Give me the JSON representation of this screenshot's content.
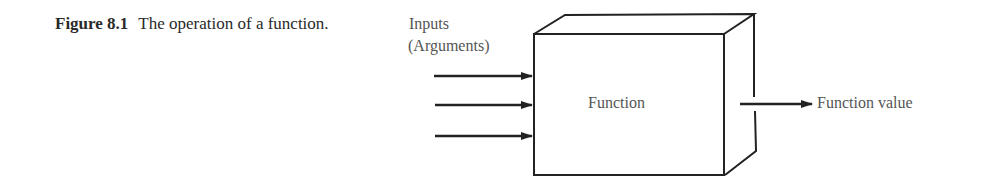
{
  "caption": {
    "figure_number": "Figure 8.1",
    "text": "The operation of a function."
  },
  "diagram": {
    "inputs_label_line1": "Inputs",
    "inputs_label_line2": "(Arguments)",
    "box_label": "Function",
    "output_label": "Function value",
    "input_arrow_count": 3,
    "stroke_color": "#222222",
    "text_color": "#555555"
  }
}
